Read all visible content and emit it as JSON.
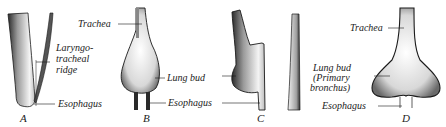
{
  "figure": {
    "panels": [
      {
        "id": "A",
        "letter": "A",
        "labels": {
          "ridge_line1": "Laryngo-",
          "ridge_line2": "tracheal",
          "ridge_line3": "ridge",
          "esophagus": "Esophagus"
        }
      },
      {
        "id": "B",
        "letter": "B",
        "labels": {
          "trachea": "Trachea",
          "lung_bud": "Lung bud",
          "esophagus": "Esophagus"
        }
      },
      {
        "id": "C",
        "letter": "C",
        "labels": {}
      },
      {
        "id": "D",
        "letter": "D",
        "labels": {
          "trachea": "Trachea",
          "lung_bud_line1": "Lung bud",
          "lung_bud_line2": "(Primary",
          "lung_bud_line3": "bronchus)",
          "esophagus": "Esophagus"
        }
      }
    ]
  },
  "colors": {
    "ink": "#1a1a1a",
    "shade": "#555555",
    "background": "#ffffff"
  }
}
